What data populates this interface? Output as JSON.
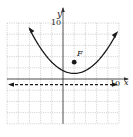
{
  "chart_data": {
    "type": "line",
    "title": "",
    "xlabel": "x",
    "ylabel": "y",
    "xlim": [
      -10,
      10
    ],
    "ylim": [
      -8,
      10
    ],
    "grid": true,
    "grid_step": 2,
    "tick_labels": {
      "x": [
        "10"
      ],
      "y": [
        "10"
      ]
    },
    "series": [
      {
        "name": "parabola",
        "equation": "(x-2)^2 = 8(y-1)",
        "style": "solid",
        "arrows": "both",
        "x": [
          -6,
          -4,
          -2,
          0,
          2,
          4,
          6,
          8,
          10
        ],
        "y": [
          9,
          5.5,
          3,
          1.5,
          1,
          1.5,
          3,
          5.5,
          9
        ]
      },
      {
        "name": "directrix",
        "equation": "y = -1",
        "style": "dashed",
        "arrows": "both",
        "x": [
          -10,
          10
        ],
        "y": [
          -1,
          -1
        ]
      }
    ],
    "points": [
      {
        "label": "F",
        "x": 2,
        "y": 3
      }
    ]
  },
  "labels": {
    "y_axis": "y",
    "x_axis": "x",
    "y_tick": "10",
    "x_tick": "10",
    "focus": "F"
  },
  "colors": {
    "curve": "#1a1a1a",
    "grid": "#9a9a9a",
    "axis": "#333333"
  }
}
